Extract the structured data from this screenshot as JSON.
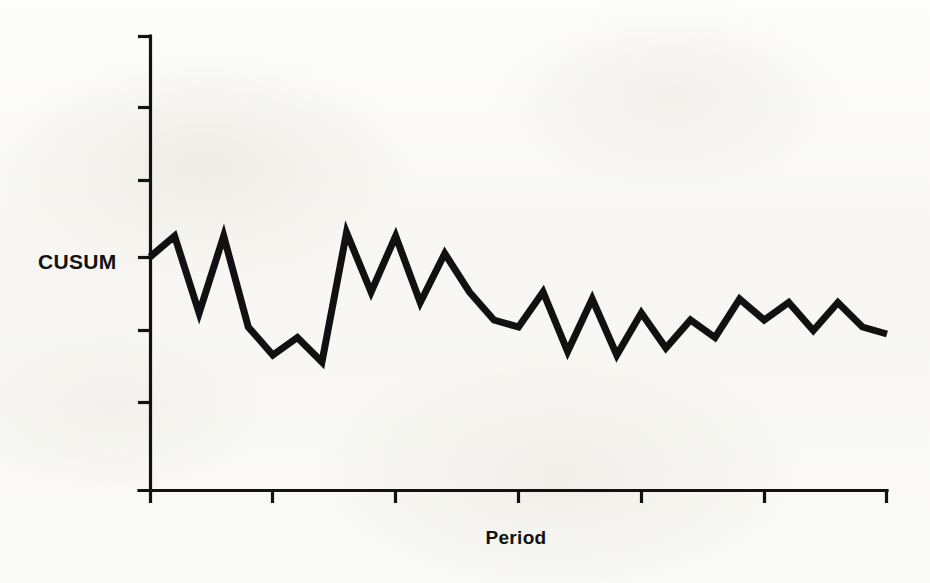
{
  "labels": {
    "y_axis": "CUSUM",
    "x_axis": "Period"
  },
  "colors": {
    "line": "#111111",
    "axis": "#121212",
    "background": "#fbfbf9"
  },
  "chart_data": {
    "type": "line",
    "title": "",
    "subtitle": "",
    "xlabel": "Period",
    "ylabel": "CUSUM",
    "grid": false,
    "legend": null,
    "annotations": [],
    "x_tick_labels": [
      "",
      "",
      "",
      "",
      "",
      "",
      ""
    ],
    "y_tick_labels": [
      "",
      "",
      "",
      "",
      "",
      ""
    ],
    "x_tick_count": 7,
    "y_tick_count": 6,
    "xlim": [
      0,
      30
    ],
    "ylim": [
      -3.25,
      3.25
    ],
    "note": "Zero reference level of CUSUM aligns with the 4th y-axis tick from the top, where the series starts.",
    "x": [
      0,
      1,
      2,
      3,
      4,
      5,
      6,
      7,
      8,
      9,
      10,
      11,
      12,
      13,
      14,
      15,
      16,
      17,
      18,
      19,
      20,
      21,
      22,
      23,
      24,
      25,
      26,
      27,
      28,
      29,
      30
    ],
    "values": [
      0.0,
      0.3,
      -0.8,
      0.3,
      -1.0,
      -1.4,
      -1.15,
      -1.5,
      0.35,
      -0.5,
      0.3,
      -0.65,
      0.05,
      -0.5,
      -0.9,
      -1.0,
      -0.5,
      -1.35,
      -0.6,
      -1.4,
      -0.8,
      -1.3,
      -0.9,
      -1.15,
      -0.6,
      -0.9,
      -0.65,
      -1.05,
      -0.65,
      -1.0,
      -1.1
    ],
    "series": [
      {
        "name": "CUSUM",
        "values": [
          0.0,
          0.3,
          -0.8,
          0.3,
          -1.0,
          -1.4,
          -1.15,
          -1.5,
          0.35,
          -0.5,
          0.3,
          -0.65,
          0.05,
          -0.5,
          -0.9,
          -1.0,
          -0.5,
          -1.35,
          -0.6,
          -1.4,
          -0.8,
          -1.3,
          -0.9,
          -1.15,
          -0.6,
          -0.9,
          -0.65,
          -1.05,
          -0.65,
          -1.0,
          -1.1
        ]
      }
    ]
  }
}
